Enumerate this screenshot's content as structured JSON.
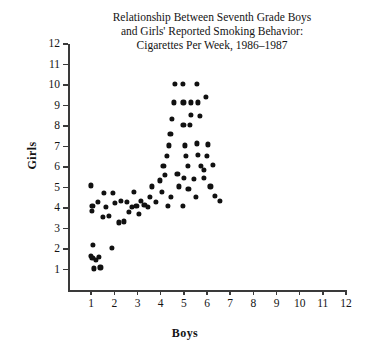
{
  "chart_data": {
    "type": "scatter",
    "title_lines": [
      "Relationship Between Seventh Grade Boys",
      "and Girls' Reported Smoking Behavior:",
      "Cigarettes Per Week, 1986–1987"
    ],
    "xlabel": "Boys",
    "ylabel": "Girls",
    "xlim": [
      0,
      12
    ],
    "ylim": [
      0,
      12
    ],
    "xticks": [
      1,
      2,
      3,
      4,
      5,
      6,
      7,
      8,
      9,
      10,
      11,
      12
    ],
    "yticks": [
      1,
      2,
      3,
      4,
      5,
      6,
      7,
      8,
      9,
      10,
      11,
      12
    ],
    "grid": false,
    "legend": false,
    "marker": "filled-circle",
    "marker_color": "#111111",
    "axis_color": "#3a3a3a",
    "background": "#ffffff",
    "n_points": 76,
    "points": [
      [
        1.0,
        5.1
      ],
      [
        1.02,
        3.85
      ],
      [
        1.05,
        4.1
      ],
      [
        1.3,
        4.3
      ],
      [
        1.08,
        2.2
      ],
      [
        1.0,
        1.65
      ],
      [
        1.05,
        1.55
      ],
      [
        1.2,
        1.45
      ],
      [
        1.35,
        1.62
      ],
      [
        1.12,
        1.05
      ],
      [
        1.4,
        1.1
      ],
      [
        1.55,
        4.75
      ],
      [
        1.62,
        4.05
      ],
      [
        1.5,
        3.55
      ],
      [
        1.78,
        3.6
      ],
      [
        1.95,
        4.75
      ],
      [
        2.02,
        4.25
      ],
      [
        1.88,
        2.05
      ],
      [
        2.2,
        3.3
      ],
      [
        2.42,
        3.35
      ],
      [
        2.3,
        4.35
      ],
      [
        2.55,
        4.3
      ],
      [
        2.62,
        3.8
      ],
      [
        2.75,
        4.05
      ],
      [
        2.95,
        4.1
      ],
      [
        3.05,
        3.7
      ],
      [
        3.15,
        4.35
      ],
      [
        3.3,
        4.15
      ],
      [
        2.85,
        4.8
      ],
      [
        3.55,
        4.55
      ],
      [
        3.62,
        5.05
      ],
      [
        3.78,
        4.3
      ],
      [
        3.95,
        5.35
      ],
      [
        4.05,
        4.8
      ],
      [
        4.2,
        5.6
      ],
      [
        4.12,
        6.05
      ],
      [
        4.28,
        6.55
      ],
      [
        4.35,
        7.05
      ],
      [
        4.42,
        7.6
      ],
      [
        4.5,
        8.35
      ],
      [
        4.58,
        9.15
      ],
      [
        4.62,
        10.05
      ],
      [
        4.95,
        10.05
      ],
      [
        5.55,
        10.05
      ],
      [
        4.98,
        9.15
      ],
      [
        5.3,
        9.15
      ],
      [
        5.62,
        9.15
      ],
      [
        5.95,
        9.4
      ],
      [
        5.3,
        8.55
      ],
      [
        5.68,
        8.5
      ],
      [
        4.98,
        8.05
      ],
      [
        5.25,
        8.05
      ],
      [
        5.05,
        7.05
      ],
      [
        5.55,
        7.15
      ],
      [
        6.05,
        7.1
      ],
      [
        5.08,
        6.55
      ],
      [
        5.62,
        6.6
      ],
      [
        6.0,
        6.55
      ],
      [
        5.18,
        6.05
      ],
      [
        5.72,
        6.05
      ],
      [
        5.0,
        5.45
      ],
      [
        5.45,
        5.4
      ],
      [
        5.88,
        5.45
      ],
      [
        4.72,
        5.65
      ],
      [
        4.8,
        5.05
      ],
      [
        5.2,
        4.95
      ],
      [
        6.15,
        5.05
      ],
      [
        5.52,
        4.55
      ],
      [
        6.35,
        4.6
      ],
      [
        4.45,
        4.55
      ],
      [
        4.3,
        4.1
      ],
      [
        4.95,
        4.1
      ],
      [
        6.55,
        4.35
      ],
      [
        5.85,
        5.85
      ],
      [
        6.25,
        6.1
      ],
      [
        3.45,
        4.05
      ]
    ]
  }
}
